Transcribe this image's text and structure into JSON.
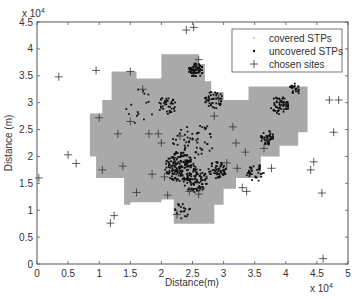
{
  "chart_data": {
    "type": "scatter",
    "title": "",
    "xlabel": "Distance(m)",
    "ylabel": "Distance (m)",
    "x_exponent": "x 10^4",
    "y_exponent": "x 10^4",
    "xlim": [
      0,
      5
    ],
    "ylim": [
      0,
      4.5
    ],
    "xticks": [
      "0",
      "0.5",
      "1",
      "1.5",
      "2",
      "2.5",
      "3",
      "3.5",
      "4",
      "4.5",
      "5"
    ],
    "yticks": [
      "0",
      "0.5",
      "1",
      "1.5",
      "2",
      "2.5",
      "3",
      "3.5",
      "4",
      "4.5"
    ],
    "grid": false,
    "legend_position": "upper right",
    "legend": [
      {
        "label": "covered STPs",
        "marker": "dot-light"
      },
      {
        "label": "uncovered STPs",
        "marker": "dot-dark"
      },
      {
        "label": "chosen sites",
        "marker": "plus"
      }
    ],
    "covered_region_color": "#a9a9a9",
    "uncovered_color": "#111111",
    "sites_color": "#333333",
    "series": [
      {
        "name": "chosen sites",
        "points": [
          [
            0.03,
            1.6
          ],
          [
            0.5,
            2.03
          ],
          [
            0.63,
            1.87
          ],
          [
            1.05,
            1.75
          ],
          [
            1.38,
            1.82
          ],
          [
            1.6,
            1.33
          ],
          [
            1.18,
            0.76
          ],
          [
            1.24,
            0.9
          ],
          [
            0.35,
            3.48
          ],
          [
            0.95,
            3.6
          ],
          [
            1.5,
            3.58
          ],
          [
            1.7,
            3.25
          ],
          [
            1.5,
            2.65
          ],
          [
            1.0,
            2.72
          ],
          [
            1.3,
            2.42
          ],
          [
            1.8,
            2.42
          ],
          [
            1.95,
            2.42
          ],
          [
            2.3,
            2.38
          ],
          [
            2.25,
            0.92
          ],
          [
            2.4,
            4.35
          ],
          [
            2.52,
            4.4
          ],
          [
            2.6,
            3.8
          ],
          [
            2.92,
            3.08
          ],
          [
            2.85,
            2.75
          ],
          [
            3.15,
            2.55
          ],
          [
            3.2,
            2.25
          ],
          [
            3.35,
            2.08
          ],
          [
            3.05,
            1.88
          ],
          [
            3.65,
            2.15
          ],
          [
            3.22,
            1.78
          ],
          [
            3.3,
            1.42
          ],
          [
            3.77,
            1.78
          ],
          [
            3.37,
            1.35
          ],
          [
            4.45,
            1.9
          ],
          [
            4.4,
            1.75
          ],
          [
            4.58,
            1.32
          ],
          [
            4.6,
            0.1
          ],
          [
            4.7,
            3.05
          ],
          [
            4.85,
            3.05
          ],
          [
            4.77,
            2.45
          ],
          [
            2.45,
            1.35
          ],
          [
            2.05,
            1.62
          ],
          [
            1.85,
            1.67
          ],
          [
            2.1,
            1.28
          ],
          [
            2.0,
            2.25
          ],
          [
            2.6,
            1.3
          ]
        ]
      }
    ],
    "covered_region_outline_x1e4": [
      [
        1.2,
        3.58
      ],
      [
        1.6,
        3.58
      ],
      [
        1.6,
        3.45
      ],
      [
        2.0,
        3.45
      ],
      [
        2.0,
        3.9
      ],
      [
        2.6,
        3.9
      ],
      [
        2.6,
        3.72
      ],
      [
        2.7,
        3.72
      ],
      [
        2.7,
        3.4
      ],
      [
        2.8,
        3.4
      ],
      [
        2.8,
        3.2
      ],
      [
        3.0,
        3.2
      ],
      [
        3.0,
        3.05
      ],
      [
        3.4,
        3.05
      ],
      [
        3.4,
        3.3
      ],
      [
        4.35,
        3.3
      ],
      [
        4.35,
        2.45
      ],
      [
        4.2,
        2.45
      ],
      [
        4.2,
        2.2
      ],
      [
        3.9,
        2.2
      ],
      [
        3.9,
        2.0
      ],
      [
        3.6,
        2.0
      ],
      [
        3.6,
        1.6
      ],
      [
        3.2,
        1.6
      ],
      [
        3.2,
        1.4
      ],
      [
        3.0,
        1.4
      ],
      [
        3.0,
        1.1
      ],
      [
        2.85,
        1.1
      ],
      [
        2.85,
        0.75
      ],
      [
        2.2,
        0.75
      ],
      [
        2.2,
        1.2
      ],
      [
        2.0,
        1.2
      ],
      [
        2.0,
        1.15
      ],
      [
        1.5,
        1.15
      ],
      [
        1.5,
        1.1
      ],
      [
        1.4,
        1.1
      ],
      [
        1.4,
        1.6
      ],
      [
        0.95,
        1.6
      ],
      [
        0.95,
        2.0
      ],
      [
        0.85,
        2.0
      ],
      [
        0.85,
        2.8
      ],
      [
        1.05,
        2.8
      ],
      [
        1.05,
        3.05
      ],
      [
        1.2,
        3.05
      ]
    ]
  },
  "axes": {
    "x_multiplier": "x 10",
    "x_multiplier_exp": "4",
    "y_multiplier": "x 10",
    "y_multiplier_exp": "4"
  }
}
